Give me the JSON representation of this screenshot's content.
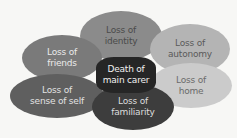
{
  "diagram": {
    "type": "overlapping-ellipses",
    "center": {
      "label": "Death of\nmain carer",
      "color": "#262626"
    },
    "nodes": [
      {
        "id": "identity",
        "label": "Loss of\nidentity",
        "color": "#8b8b8b"
      },
      {
        "id": "friends",
        "label": "Loss of\nfriends",
        "color": "#7a7a7a"
      },
      {
        "id": "autonomy",
        "label": "Loss of\nautonomy",
        "color": "#b4b4b4"
      },
      {
        "id": "home",
        "label": "Loss of\nhome",
        "color": "#cbcbcb"
      },
      {
        "id": "sense",
        "label": "Loss of\nsense of self",
        "color": "#5f5f5f"
      },
      {
        "id": "familiarity",
        "label": "Loss of\nfamiliarity",
        "color": "#3d3d3d"
      }
    ]
  }
}
